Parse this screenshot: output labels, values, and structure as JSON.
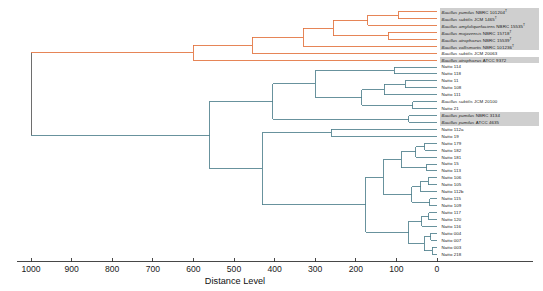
{
  "chart_data": {
    "type": "dendrogram",
    "title": "",
    "xlabel": "Distance Level",
    "ylabel": "",
    "xlim": [
      1000,
      0
    ],
    "x_ticks": [
      1000,
      900,
      800,
      700,
      600,
      500,
      400,
      300,
      200,
      100,
      0
    ],
    "x_tick_labels": [
      "1000",
      "900",
      "800",
      "700",
      "600",
      "500",
      "400",
      "300",
      "200",
      "100",
      "0"
    ],
    "axis_direction": "reversed",
    "grid": false,
    "legend": null,
    "n_leaves": 34,
    "colors": {
      "clade_orange": "#e2703a",
      "clade_teal": "#4d7f8c",
      "root": "#555555",
      "highlight": "#bdbdbd",
      "axis": "#333333"
    },
    "leaves": [
      {
        "i": 0,
        "label": "Bacillus pumilus NBRC 101204",
        "italic_prefix": "Bacillus pumilus",
        "strain": "NBRC 101204",
        "type_strain": true,
        "clade": "orange",
        "highlight": true
      },
      {
        "i": 1,
        "label": "Bacillus subtilis JCM 1465",
        "italic_prefix": "Bacillus subtilis",
        "strain": "JCM 1465",
        "type_strain": true,
        "clade": "orange",
        "highlight": true
      },
      {
        "i": 2,
        "label": "Bacillus amyloliquefaciens NBRC 15535",
        "italic_prefix": "Bacillus amyloliquefaciens",
        "strain": "NBRC 15535",
        "type_strain": true,
        "clade": "orange",
        "highlight": true
      },
      {
        "i": 3,
        "label": "Bacillus mojavensis NBRC 15718",
        "italic_prefix": "Bacillus mojavensis",
        "strain": "NBRC 15718",
        "type_strain": true,
        "clade": "orange",
        "highlight": true
      },
      {
        "i": 4,
        "label": "Bacillus atrophaeus NBRC 15539",
        "italic_prefix": "Bacillus atrophaeus",
        "strain": "NBRC 15539",
        "type_strain": true,
        "clade": "orange",
        "highlight": true
      },
      {
        "i": 5,
        "label": "Bacillus vallismortis NBRC 101236",
        "italic_prefix": "Bacillus vallismortis",
        "strain": "NBRC 101236",
        "type_strain": true,
        "clade": "orange",
        "highlight": true
      },
      {
        "i": 6,
        "label": "Bacillus subtilis JCM 20063",
        "italic_prefix": "Bacillus subtilis",
        "strain": "JCM 20063",
        "type_strain": false,
        "clade": "orange",
        "highlight": false
      },
      {
        "i": 7,
        "label": "Bacillus atrophaeus ATCC 9372",
        "italic_prefix": "Bacillus atrophaeus",
        "strain": "ATCC 9372",
        "type_strain": false,
        "clade": "orange",
        "highlight": true
      },
      {
        "i": 8,
        "label": "Natto 114",
        "clade": "teal",
        "highlight": false
      },
      {
        "i": 9,
        "label": "Natto 118",
        "clade": "teal",
        "highlight": false
      },
      {
        "i": 10,
        "label": "Natto 11",
        "clade": "teal",
        "highlight": false
      },
      {
        "i": 11,
        "label": "Natto 108",
        "clade": "teal",
        "highlight": false
      },
      {
        "i": 12,
        "label": "Natto 111",
        "clade": "teal",
        "highlight": false
      },
      {
        "i": 13,
        "label": "Bacillus subtilis JCM 20100",
        "italic_prefix": "Bacillus subtilis",
        "strain": "JCM 20100",
        "type_strain": false,
        "clade": "teal",
        "highlight": false
      },
      {
        "i": 14,
        "label": "Natto 21",
        "clade": "teal",
        "highlight": false
      },
      {
        "i": 15,
        "label": "Bacillus pumilus NBRC 3134",
        "italic_prefix": "Bacillus pumilus",
        "strain": "NBRC 3134",
        "type_strain": false,
        "clade": "teal",
        "highlight": true
      },
      {
        "i": 16,
        "label": "Bacillus pumilus ATCC 4635",
        "italic_prefix": "Bacillus pumilus",
        "strain": "ATCC 4635",
        "type_strain": false,
        "clade": "teal",
        "highlight": true
      },
      {
        "i": 17,
        "label": "Natto 112a",
        "clade": "teal",
        "highlight": false
      },
      {
        "i": 18,
        "label": "Natto 19",
        "clade": "teal",
        "highlight": false
      },
      {
        "i": 19,
        "label": "Natto 179",
        "clade": "teal",
        "highlight": false
      },
      {
        "i": 20,
        "label": "Natto 182",
        "clade": "teal",
        "highlight": false
      },
      {
        "i": 21,
        "label": "Natto 181",
        "clade": "teal",
        "highlight": false
      },
      {
        "i": 22,
        "label": "Natto 15",
        "clade": "teal",
        "highlight": false
      },
      {
        "i": 23,
        "label": "Natto 113",
        "clade": "teal",
        "highlight": false
      },
      {
        "i": 24,
        "label": "Natto 106",
        "clade": "teal",
        "highlight": false
      },
      {
        "i": 25,
        "label": "Natto 105",
        "clade": "teal",
        "highlight": false
      },
      {
        "i": 26,
        "label": "Natto 112b",
        "clade": "teal",
        "highlight": false
      },
      {
        "i": 27,
        "label": "Natto 115",
        "clade": "teal",
        "highlight": false
      },
      {
        "i": 28,
        "label": "Natto 109",
        "clade": "teal",
        "highlight": false
      },
      {
        "i": 29,
        "label": "Natto 117",
        "clade": "teal",
        "highlight": false
      },
      {
        "i": 30,
        "label": "Natto 120",
        "clade": "teal",
        "highlight": false
      },
      {
        "i": 31,
        "label": "Natto 116",
        "clade": "teal",
        "highlight": false
      },
      {
        "i": 32,
        "label": "Natto 004",
        "clade": "teal",
        "highlight": false
      },
      {
        "i": 33,
        "label": "Natto 007",
        "clade": "teal",
        "highlight": false
      },
      {
        "i": 34,
        "label": "Natto 003",
        "clade": "teal",
        "highlight": false
      },
      {
        "i": 35,
        "label": "Natto 218",
        "clade": "teal",
        "highlight": false
      }
    ],
    "merges": [
      {
        "id": "m1",
        "clade": "orange",
        "height": 95,
        "children": [
          "leaf:0",
          "leaf:1"
        ]
      },
      {
        "id": "m2",
        "clade": "orange",
        "height": 170,
        "children": [
          "m1",
          "leaf:2"
        ]
      },
      {
        "id": "m3",
        "clade": "orange",
        "height": 120,
        "children": [
          "leaf:3",
          "leaf:4"
        ]
      },
      {
        "id": "m4",
        "clade": "orange",
        "height": 255,
        "children": [
          "m2",
          "m3"
        ]
      },
      {
        "id": "m5",
        "clade": "orange",
        "height": 330,
        "children": [
          "m4",
          "leaf:5"
        ]
      },
      {
        "id": "m6",
        "clade": "orange",
        "height": 455,
        "children": [
          "m5",
          "leaf:6"
        ]
      },
      {
        "id": "m7",
        "clade": "orange",
        "height": 600,
        "children": [
          "m6",
          "leaf:7"
        ]
      },
      {
        "id": "m8",
        "clade": "teal",
        "height": 105,
        "children": [
          "leaf:8",
          "leaf:9"
        ]
      },
      {
        "id": "m9",
        "clade": "teal",
        "height": 78,
        "children": [
          "leaf:10",
          "leaf:11"
        ]
      },
      {
        "id": "m10",
        "clade": "teal",
        "height": 130,
        "children": [
          "m9",
          "leaf:12"
        ]
      },
      {
        "id": "m11",
        "clade": "teal",
        "height": 60,
        "children": [
          "leaf:13",
          "leaf:14"
        ]
      },
      {
        "id": "m12",
        "clade": "teal",
        "height": 185,
        "children": [
          "m10",
          "m11"
        ]
      },
      {
        "id": "m13",
        "clade": "teal",
        "height": 300,
        "children": [
          "m8",
          "m12"
        ]
      },
      {
        "id": "m14",
        "clade": "teal",
        "height": 70,
        "children": [
          "leaf:15",
          "leaf:16"
        ]
      },
      {
        "id": "m15",
        "clade": "teal",
        "height": 405,
        "children": [
          "m13",
          "m14"
        ]
      },
      {
        "id": "m16",
        "clade": "teal",
        "height": 30,
        "children": [
          "leaf:19",
          "leaf:20"
        ]
      },
      {
        "id": "m17",
        "clade": "teal",
        "height": 52,
        "children": [
          "m16",
          "leaf:21"
        ]
      },
      {
        "id": "m18",
        "clade": "teal",
        "height": 25,
        "children": [
          "leaf:22",
          "leaf:23"
        ]
      },
      {
        "id": "m19",
        "clade": "teal",
        "height": 88,
        "children": [
          "m17",
          "m18"
        ]
      },
      {
        "id": "m20",
        "clade": "teal",
        "height": 22,
        "children": [
          "leaf:24",
          "leaf:25"
        ]
      },
      {
        "id": "m21",
        "clade": "teal",
        "height": 40,
        "children": [
          "m20",
          "leaf:26"
        ]
      },
      {
        "id": "m22",
        "clade": "teal",
        "height": 18,
        "children": [
          "leaf:27",
          "leaf:28"
        ]
      },
      {
        "id": "m23",
        "clade": "teal",
        "height": 62,
        "children": [
          "m21",
          "m22"
        ]
      },
      {
        "id": "m24",
        "clade": "teal",
        "height": 132,
        "children": [
          "m19",
          "m23"
        ]
      },
      {
        "id": "m25",
        "clade": "teal",
        "height": 20,
        "children": [
          "leaf:29",
          "leaf:30"
        ]
      },
      {
        "id": "m26",
        "clade": "teal",
        "height": 38,
        "children": [
          "m25",
          "leaf:31"
        ]
      },
      {
        "id": "m27",
        "clade": "teal",
        "height": 15,
        "children": [
          "leaf:32",
          "leaf:33"
        ]
      },
      {
        "id": "m28",
        "clade": "teal",
        "height": 12,
        "children": [
          "leaf:34",
          "leaf:35"
        ]
      },
      {
        "id": "m29",
        "clade": "teal",
        "height": 32,
        "children": [
          "m27",
          "m28"
        ]
      },
      {
        "id": "m30",
        "clade": "teal",
        "height": 70,
        "children": [
          "m26",
          "m29"
        ]
      },
      {
        "id": "m31",
        "clade": "teal",
        "height": 175,
        "children": [
          "m24",
          "m30"
        ]
      },
      {
        "id": "m32",
        "clade": "teal",
        "height": 260,
        "children": [
          "leaf:17",
          "leaf:18"
        ]
      },
      {
        "id": "m33",
        "clade": "teal",
        "height": 430,
        "children": [
          "m32",
          "m31"
        ]
      },
      {
        "id": "m34",
        "clade": "teal",
        "height": 560,
        "children": [
          "m15",
          "m33"
        ]
      },
      {
        "id": "root",
        "clade": "root",
        "height": 1000,
        "children": [
          "m7",
          "m34"
        ]
      }
    ]
  }
}
